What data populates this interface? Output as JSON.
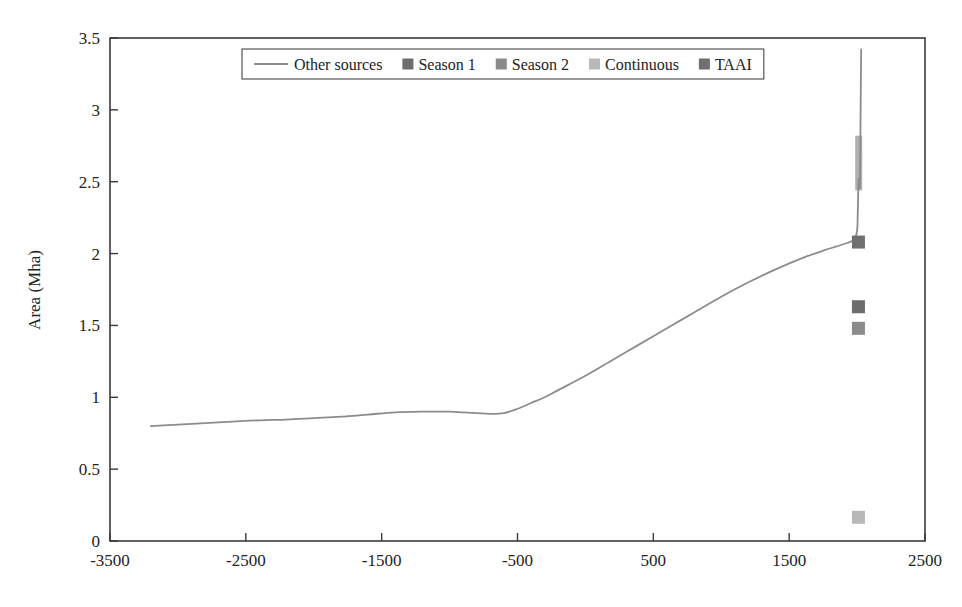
{
  "chart_data": {
    "type": "line",
    "title": "",
    "xlabel": "",
    "ylabel": "Area (Mha)",
    "xlim": [
      -3500,
      2500
    ],
    "ylim": [
      0,
      3.5
    ],
    "xticks": [
      -3500,
      -2500,
      -1500,
      -500,
      500,
      1500,
      2500
    ],
    "xtick_labels": [
      "-3500",
      "-2500",
      "-1500",
      "-500",
      "500",
      "1500",
      "2500"
    ],
    "yticks": [
      0,
      0.5,
      1,
      1.5,
      2,
      2.5,
      3,
      3.5
    ],
    "ytick_labels": [
      "0",
      "0.5",
      "1",
      "1.5",
      "2",
      "2.5",
      "3",
      "3.5"
    ],
    "grid": false,
    "legend_position": "top-center",
    "series": [
      {
        "name": "Other sources",
        "type": "line",
        "color": "#8c8c8c",
        "points": [
          [
            -3200,
            0.8
          ],
          [
            -3000,
            0.81
          ],
          [
            -2800,
            0.82
          ],
          [
            -2600,
            0.83
          ],
          [
            -2400,
            0.84
          ],
          [
            -2200,
            0.845
          ],
          [
            -2000,
            0.855
          ],
          [
            -1800,
            0.865
          ],
          [
            -1600,
            0.88
          ],
          [
            -1400,
            0.895
          ],
          [
            -1200,
            0.9
          ],
          [
            -1000,
            0.9
          ],
          [
            -900,
            0.895
          ],
          [
            -800,
            0.89
          ],
          [
            -700,
            0.885
          ],
          [
            -600,
            0.89
          ],
          [
            -500,
            0.92
          ],
          [
            -400,
            0.96
          ],
          [
            -300,
            1.0
          ],
          [
            -200,
            1.05
          ],
          [
            0,
            1.15
          ],
          [
            200,
            1.26
          ],
          [
            400,
            1.37
          ],
          [
            600,
            1.48
          ],
          [
            800,
            1.59
          ],
          [
            1000,
            1.7
          ],
          [
            1200,
            1.8
          ],
          [
            1400,
            1.89
          ],
          [
            1600,
            1.97
          ],
          [
            1750,
            2.02
          ],
          [
            1850,
            2.05
          ],
          [
            1930,
            2.075
          ],
          [
            1980,
            2.1
          ],
          [
            2000,
            2.16
          ],
          [
            2005,
            2.28
          ],
          [
            2008,
            2.42
          ],
          [
            2010,
            2.5
          ],
          [
            2012,
            2.52
          ],
          [
            2016,
            2.48
          ],
          [
            2020,
            2.46
          ],
          [
            2022,
            2.55
          ],
          [
            2024,
            2.75
          ],
          [
            2026,
            3.0
          ],
          [
            2028,
            3.2
          ],
          [
            2030,
            3.42
          ]
        ]
      },
      {
        "name": "Season 1",
        "type": "scatter",
        "color": "#6d6d6d",
        "points": [
          [
            2010,
            1.63
          ]
        ]
      },
      {
        "name": "Season 2",
        "type": "scatter",
        "color": "#8b8b8b",
        "points": [
          [
            2010,
            1.48
          ]
        ]
      },
      {
        "name": "Continuous",
        "type": "scatter",
        "color": "#b9b9b9",
        "points": [
          [
            2010,
            0.165
          ]
        ]
      },
      {
        "name": "TAAI",
        "type": "scatter",
        "color": "#707070",
        "points": [
          [
            2010,
            2.08
          ]
        ]
      }
    ],
    "annotations": [
      {
        "name": "continuous-band",
        "color": "#b0b0b0",
        "x": 2012,
        "y_low": 2.44,
        "y_high": 2.82
      }
    ]
  },
  "legend": {
    "entries": [
      {
        "label": "Other sources",
        "marker": "line",
        "color": "#8c8c8c"
      },
      {
        "label": "Season 1",
        "marker": "square",
        "color": "#6d6d6d"
      },
      {
        "label": "Season 2",
        "marker": "square",
        "color": "#8b8b8b"
      },
      {
        "label": "Continuous",
        "marker": "square",
        "color": "#b9b9b9"
      },
      {
        "label": "TAAI",
        "marker": "square",
        "color": "#707070"
      }
    ]
  },
  "axes": {
    "y_title": "Area (Mha)",
    "x_title": "",
    "y_tick_labels": [
      "3.5",
      "3",
      "2.5",
      "2",
      "1.5",
      "1",
      "0.5",
      "0"
    ],
    "x_tick_labels": [
      "-3500",
      "-2500",
      "-1500",
      "-500",
      "500",
      "1500",
      "2500"
    ]
  }
}
